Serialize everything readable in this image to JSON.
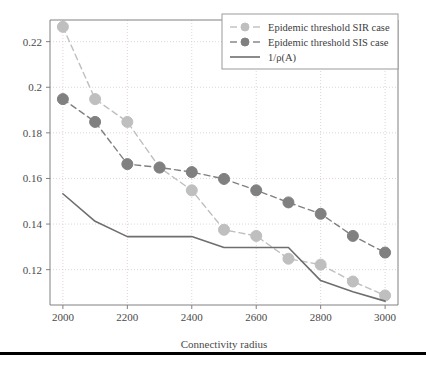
{
  "figure": {
    "background_color": "#ffffff",
    "axes_color": "#808080",
    "grid_color": "#d9c9c9",
    "text_color": "#4a4a4a",
    "rule": {
      "name": "bottom-rule",
      "color": "#000000",
      "y": 352,
      "height": 3
    }
  },
  "chart_data": {
    "type": "line",
    "title": "",
    "xlabel": "Connectivity radius",
    "ylabel": "",
    "xlim": [
      1960,
      3040
    ],
    "ylim": [
      0.1045,
      0.2295
    ],
    "xticks": [
      2000,
      2200,
      2400,
      2600,
      2800,
      3000
    ],
    "xtick_labels": [
      "2000",
      "2200",
      "2400",
      "2600",
      "2800",
      "3000"
    ],
    "yticks": [
      0.12,
      0.14,
      0.16,
      0.18,
      0.2,
      0.22
    ],
    "ytick_labels": [
      "0.12",
      "0.14",
      "0.16",
      "0.18",
      "0.2",
      "0.22"
    ],
    "grid": true,
    "grid_style": "dotted",
    "legend_position": "upper right",
    "x": [
      2000,
      2100,
      2200,
      2300,
      2400,
      2500,
      2600,
      2700,
      2800,
      2900,
      3000
    ],
    "series": [
      {
        "name": "Epidemic threshold SIR case",
        "legend_label": "Epidemic threshold SIR case",
        "color": "#bfbfbf",
        "linestyle": "dashed",
        "marker": "circle",
        "marker_size": 5.5,
        "values": [
          0.2265,
          0.1948,
          0.1848,
          0.1648,
          0.1548,
          0.1375,
          0.1348,
          0.1248,
          0.1222,
          0.1148,
          0.1087
        ]
      },
      {
        "name": "Epidemic threshold SIS case",
        "legend_label": "Epidemic threshold SIS case",
        "color": "#808080",
        "linestyle": "dashed",
        "marker": "circle",
        "marker_size": 5.5,
        "values": [
          0.1948,
          0.1848,
          0.1663,
          0.1648,
          0.1628,
          0.1598,
          0.1548,
          0.1495,
          0.1445,
          0.1348,
          0.1275
        ]
      },
      {
        "name": "1/rho(A)",
        "legend_label": "1/ρ(A)",
        "legend_label_prefix": "1/",
        "legend_label_rho": "ρ(",
        "legend_label_italic": "A",
        "legend_label_suffix": ")",
        "color": "#6e6e6e",
        "linestyle": "solid",
        "marker": "none",
        "marker_size": 0,
        "values": [
          0.1533,
          0.1412,
          0.1345,
          0.1345,
          0.1345,
          0.1297,
          0.1297,
          0.1297,
          0.1152,
          0.1103,
          0.1062
        ]
      }
    ]
  },
  "legend": {
    "name": "chart-legend",
    "border_color": "#9a9a9a",
    "background": "#ffffff",
    "entries": [
      {
        "label": "Epidemic threshold SIR case",
        "color": "#bfbfbf",
        "style": "dashed-marker"
      },
      {
        "label": "Epidemic threshold SIS case",
        "color": "#808080",
        "style": "dashed-marker"
      },
      {
        "label": "1/ρ(A)",
        "color": "#6e6e6e",
        "style": "solid"
      }
    ]
  }
}
